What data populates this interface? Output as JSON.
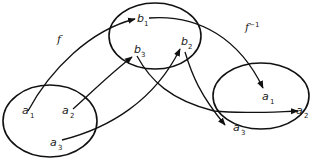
{
  "diagram": {
    "function_labels": {
      "f": "f",
      "f_inverse_base": "f",
      "f_inverse_sup": "−1"
    },
    "sets": [
      {
        "name": "domain-A",
        "elements": [
          {
            "base": "a",
            "sub": "1"
          },
          {
            "base": "a",
            "sub": "2"
          },
          {
            "base": "a",
            "sub": "3"
          }
        ]
      },
      {
        "name": "codomain-B",
        "elements": [
          {
            "base": "b",
            "sub": "1"
          },
          {
            "base": "b",
            "sub": "3"
          },
          {
            "base": "b",
            "sub": "2"
          }
        ]
      },
      {
        "name": "image-A",
        "elements": [
          {
            "base": "a",
            "sub": "1"
          },
          {
            "base": "a",
            "sub": "2"
          },
          {
            "base": "a",
            "sub": "3"
          }
        ]
      }
    ],
    "mappings_f": [
      {
        "from": "a1",
        "to": "b1"
      },
      {
        "from": "a2",
        "to": "b3"
      },
      {
        "from": "a3",
        "to": "b2"
      }
    ],
    "mappings_f_inverse": [
      {
        "from": "b1",
        "to": "a1"
      },
      {
        "from": "b3",
        "to": "a2"
      },
      {
        "from": "b2",
        "to": "a3"
      }
    ],
    "stroke_color": "#111111",
    "background": "#ffffff"
  }
}
